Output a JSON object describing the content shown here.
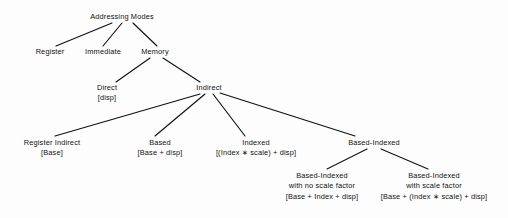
{
  "diagram": {
    "title": "Addressing Modes",
    "type": "tree",
    "background_color": "#fdfdfd",
    "line_color": "#111111",
    "text_color": "#111111",
    "nodes": [
      {
        "id": "addressing-modes",
        "lines": [
          "Addressing Modes"
        ],
        "x": 122,
        "y": 17,
        "level": 0
      },
      {
        "id": "register",
        "lines": [
          "Register"
        ],
        "x": 50,
        "y": 52,
        "level": 1
      },
      {
        "id": "immediate",
        "lines": [
          "Immediate"
        ],
        "x": 103,
        "y": 52,
        "level": 1
      },
      {
        "id": "memory",
        "lines": [
          "Memory"
        ],
        "x": 155,
        "y": 52,
        "level": 1
      },
      {
        "id": "direct",
        "lines": [
          "Direct",
          "[disp]"
        ],
        "x": 107,
        "y": 88,
        "level": 2
      },
      {
        "id": "indirect",
        "lines": [
          "Indirect"
        ],
        "x": 209,
        "y": 88,
        "level": 2
      },
      {
        "id": "register-indirect",
        "lines": [
          "Register Indirect",
          "[Base]"
        ],
        "x": 52,
        "y": 143,
        "level": 3
      },
      {
        "id": "based",
        "lines": [
          "Based",
          "[Base + disp]"
        ],
        "x": 160,
        "y": 143,
        "level": 3
      },
      {
        "id": "indexed",
        "lines": [
          "Indexed",
          "[(Index ∗ scale) + disp]"
        ],
        "x": 256,
        "y": 143,
        "level": 3
      },
      {
        "id": "based-indexed",
        "lines": [
          "Based-Indexed"
        ],
        "x": 374,
        "y": 143,
        "level": 3
      },
      {
        "id": "based-indexed-no-scale",
        "lines": [
          "Based-Indexed",
          "with no scale factor",
          "[Base + Index + disp]"
        ],
        "x": 322,
        "y": 176,
        "level": 4
      },
      {
        "id": "based-indexed-scale",
        "lines": [
          "Based-Indexed",
          "with scale factor",
          "[Base + (Index ∗ scale) + disp]"
        ],
        "x": 434,
        "y": 176,
        "level": 4
      }
    ],
    "edges": [
      {
        "id": "edge-root-register",
        "from": "addressing-modes",
        "to": "register",
        "x1": 112,
        "y1": 23,
        "x2": 56,
        "y2": 46
      },
      {
        "id": "edge-root-immediate",
        "from": "addressing-modes",
        "to": "immediate",
        "x1": 122,
        "y1": 23,
        "x2": 103,
        "y2": 46
      },
      {
        "id": "edge-root-memory",
        "from": "addressing-modes",
        "to": "memory",
        "x1": 133,
        "y1": 23,
        "x2": 157,
        "y2": 46
      },
      {
        "id": "edge-memory-direct",
        "from": "memory",
        "to": "direct",
        "x1": 150,
        "y1": 58,
        "x2": 116,
        "y2": 82
      },
      {
        "id": "edge-memory-indirect",
        "from": "memory",
        "to": "indirect",
        "x1": 163,
        "y1": 58,
        "x2": 200,
        "y2": 82
      },
      {
        "id": "edge-indirect-reg-ind",
        "from": "indirect",
        "to": "register-indirect",
        "x1": 200,
        "y1": 94,
        "x2": 55,
        "y2": 136
      },
      {
        "id": "edge-indirect-based",
        "from": "indirect",
        "to": "based",
        "x1": 205,
        "y1": 94,
        "x2": 155,
        "y2": 136
      },
      {
        "id": "edge-indirect-indexed",
        "from": "indirect",
        "to": "indexed",
        "x1": 213,
        "y1": 94,
        "x2": 245,
        "y2": 136
      },
      {
        "id": "edge-indirect-based-idx",
        "from": "indirect",
        "to": "based-indexed",
        "x1": 220,
        "y1": 93,
        "x2": 355,
        "y2": 136
      },
      {
        "id": "edge-basedidx-noscale",
        "from": "based-indexed",
        "to": "based-indexed-no-scale",
        "x1": 367,
        "y1": 149,
        "x2": 327,
        "y2": 169
      },
      {
        "id": "edge-basedidx-scale",
        "from": "based-indexed",
        "to": "based-indexed-scale",
        "x1": 381,
        "y1": 149,
        "x2": 428,
        "y2": 169
      }
    ]
  }
}
